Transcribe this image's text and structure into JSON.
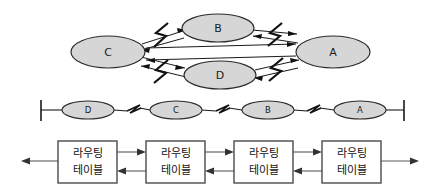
{
  "figure": {
    "title": "",
    "colors": {
      "node_fill": "#d6d6d6",
      "node_stroke": "#2b2b2b",
      "box_fill": "#ffffff",
      "box_stroke": "#4a4a4a",
      "line": "#1a1a1a",
      "flow_line": "#5a5a5a",
      "background": "#ffffff"
    }
  },
  "mesh_diagram": {
    "name": "mesh-topology",
    "nodes": [
      {
        "id": "C",
        "label": "C",
        "cx": 108,
        "cy": 52,
        "rx": 37,
        "ry": 16
      },
      {
        "id": "B",
        "label": "B",
        "cx": 218,
        "cy": 28,
        "rx": 36,
        "ry": 14
      },
      {
        "id": "D",
        "label": "D",
        "cx": 220,
        "cy": 75,
        "rx": 36,
        "ry": 14
      },
      {
        "id": "A",
        "label": "A",
        "cx": 333,
        "cy": 52,
        "rx": 37,
        "ry": 16
      }
    ],
    "links": [
      {
        "from": "C",
        "to": "B",
        "bidirectional": true,
        "symbol": "lightning-bolt"
      },
      {
        "from": "C",
        "to": "D",
        "bidirectional": true,
        "symbol": "lightning-bolt"
      },
      {
        "from": "B",
        "to": "A",
        "bidirectional": true,
        "symbol": "lightning-bolt"
      },
      {
        "from": "D",
        "to": "A",
        "bidirectional": true,
        "symbol": "lightning-bolt"
      },
      {
        "from": "C",
        "to": "A",
        "bidirectional": true,
        "symbol": "line"
      }
    ]
  },
  "bus_diagram": {
    "name": "bus-topology",
    "left_terminator": "|",
    "right_terminator": "|",
    "nodes": [
      {
        "id": "D",
        "label": "D",
        "cx": 88,
        "cy": 110,
        "rx": 26,
        "ry": 9
      },
      {
        "id": "C",
        "label": "C",
        "cx": 176,
        "cy": 110,
        "rx": 26,
        "ry": 9
      },
      {
        "id": "B",
        "label": "B",
        "cx": 268,
        "cy": 110,
        "rx": 26,
        "ry": 9
      },
      {
        "id": "A",
        "label": "A",
        "cx": 360,
        "cy": 110,
        "rx": 26,
        "ry": 9
      }
    ],
    "segments": [
      {
        "symbol": "lightning-bolt",
        "between": [
          "D",
          "C"
        ]
      },
      {
        "symbol": "lightning-bolt",
        "between": [
          "C",
          "B"
        ]
      },
      {
        "symbol": "lightning-bolt",
        "between": [
          "B",
          "A"
        ]
      }
    ]
  },
  "routing_table_row": {
    "name": "routing-table-chain",
    "boxes": [
      {
        "line1": "라우팅",
        "line2": "테이블",
        "x": 58,
        "y": 141,
        "w": 59,
        "h": 42
      },
      {
        "line1": "라우팅",
        "line2": "테이블",
        "x": 146,
        "y": 141,
        "w": 59,
        "h": 42
      },
      {
        "line1": "라우팅",
        "line2": "테이블",
        "x": 234,
        "y": 141,
        "w": 59,
        "h": 42
      },
      {
        "line1": "라우팅",
        "line2": "테이블",
        "x": 322,
        "y": 141,
        "w": 59,
        "h": 42
      }
    ],
    "connectors": [
      {
        "direction": "left",
        "role": "outbound-left-edge"
      },
      {
        "direction": "right",
        "role": "forward"
      },
      {
        "direction": "left",
        "role": "reverse"
      },
      {
        "direction": "right",
        "role": "forward"
      },
      {
        "direction": "left",
        "role": "reverse"
      },
      {
        "direction": "right",
        "role": "forward"
      },
      {
        "direction": "left",
        "role": "reverse"
      },
      {
        "direction": "right",
        "role": "outbound-right-edge"
      }
    ]
  }
}
